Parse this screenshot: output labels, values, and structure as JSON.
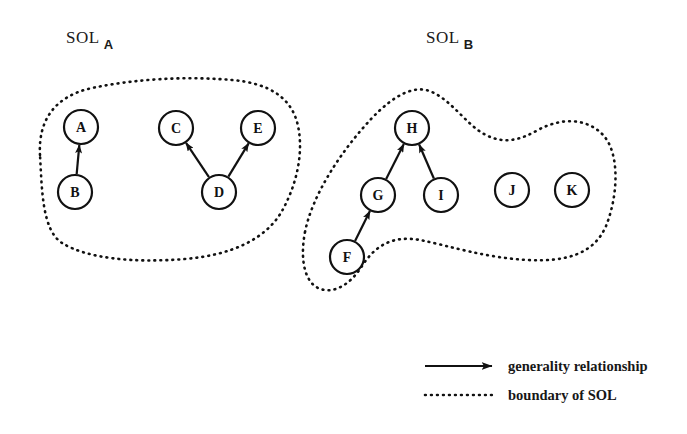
{
  "figure": {
    "title_labels": [
      {
        "name": "sol-a",
        "word": "SOL",
        "subscript": "A",
        "x": 66,
        "y": 28
      },
      {
        "name": "sol-b",
        "word": "SOL",
        "subscript": "B",
        "x": 426,
        "y": 28
      }
    ]
  },
  "nodes": [
    {
      "id": "A",
      "label": "A",
      "cx": 81,
      "cy": 127,
      "r": 17,
      "region": "SOL_A"
    },
    {
      "id": "B",
      "label": "B",
      "cx": 75,
      "cy": 192,
      "r": 17,
      "region": "SOL_A"
    },
    {
      "id": "C",
      "label": "C",
      "cx": 176,
      "cy": 128,
      "r": 17,
      "region": "SOL_A"
    },
    {
      "id": "D",
      "label": "D",
      "cx": 219,
      "cy": 192,
      "r": 17,
      "region": "SOL_A"
    },
    {
      "id": "E",
      "label": "E",
      "cx": 258,
      "cy": 128,
      "r": 17,
      "region": "SOL_A"
    },
    {
      "id": "F",
      "label": "F",
      "cx": 347,
      "cy": 257,
      "r": 17,
      "region": "SOL_B"
    },
    {
      "id": "G",
      "label": "G",
      "cx": 378,
      "cy": 195,
      "r": 17,
      "region": "SOL_B"
    },
    {
      "id": "H",
      "label": "H",
      "cx": 412,
      "cy": 128,
      "r": 17,
      "region": "SOL_B"
    },
    {
      "id": "I",
      "label": "I",
      "cx": 441,
      "cy": 195,
      "r": 17,
      "region": "SOL_B"
    },
    {
      "id": "J",
      "label": "J",
      "cx": 512,
      "cy": 190,
      "r": 17,
      "region": "SOL_B"
    },
    {
      "id": "K",
      "label": "K",
      "cx": 572,
      "cy": 190,
      "r": 17,
      "region": "SOL_B"
    }
  ],
  "edges": [
    {
      "from": "B",
      "to": "A",
      "type": "generality"
    },
    {
      "from": "D",
      "to": "C",
      "type": "generality"
    },
    {
      "from": "D",
      "to": "E",
      "type": "generality"
    },
    {
      "from": "F",
      "to": "G",
      "type": "generality"
    },
    {
      "from": "G",
      "to": "H",
      "type": "generality"
    },
    {
      "from": "I",
      "to": "H",
      "type": "generality"
    }
  ],
  "regions": [
    {
      "id": "SOL_A",
      "label": "SOL A",
      "path": "M 40 155 C 38 120 55 96 92 88 C 135 79 185 76 232 80 C 268 83 292 97 298 126 C 304 154 296 186 282 211 C 266 239 232 255 185 259 C 135 263 88 259 62 243 C 42 230 42 190 40 155 Z"
    },
    {
      "id": "SOL_B",
      "label": "SOL B",
      "path": "M 305 232 C 312 196 340 152 372 118 C 394 95 415 84 432 92 C 452 101 466 124 484 134 C 504 145 520 140 538 130 C 562 117 588 118 604 136 C 620 155 618 196 606 226 C 594 254 566 262 528 260 C 486 258 450 246 420 240 C 392 235 375 246 362 266 C 350 285 333 295 318 288 C 304 281 300 258 305 232 Z"
    }
  ],
  "legend": {
    "items": [
      {
        "icon": "arrow-icon",
        "text": "generality relationship"
      },
      {
        "icon": "dotted-line-icon",
        "text": "boundary of SOL"
      }
    ]
  },
  "colors": {
    "ink": "#111111",
    "text": "#171717",
    "background": "#ffffff"
  }
}
